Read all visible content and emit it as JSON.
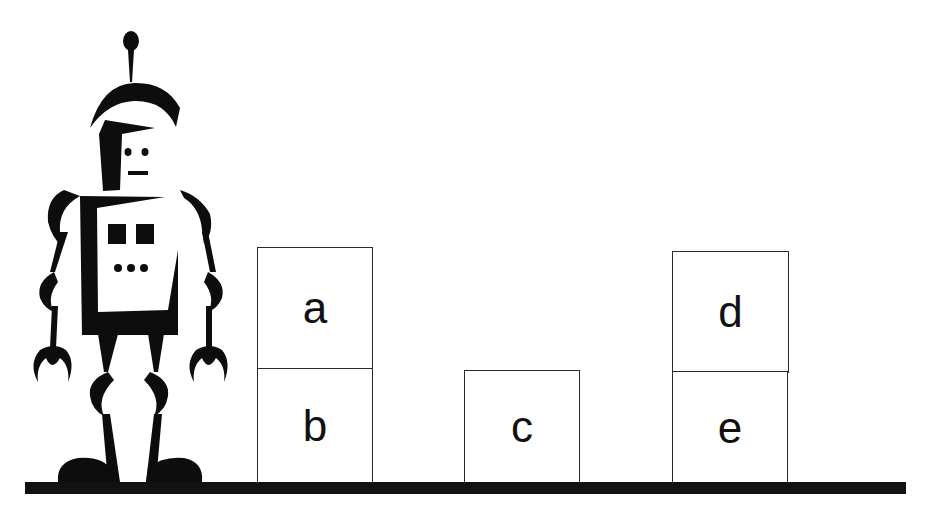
{
  "scene": {
    "description": "Blocks world: robot beside stacked lettered blocks on a table",
    "colors": {
      "ink": "#111111",
      "block_border": "#2a2a2a",
      "background": "#ffffff"
    }
  },
  "robot": {
    "label": "robot"
  },
  "blocks": [
    {
      "id": "a",
      "label": "a",
      "position": "on b"
    },
    {
      "id": "b",
      "label": "b",
      "position": "on table"
    },
    {
      "id": "c",
      "label": "c",
      "position": "on table"
    },
    {
      "id": "d",
      "label": "d",
      "position": "on e"
    },
    {
      "id": "e",
      "label": "e",
      "position": "on table"
    }
  ]
}
